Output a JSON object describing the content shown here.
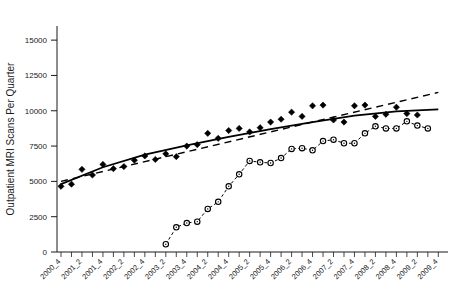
{
  "chart_data": {
    "type": "scatter",
    "title": "",
    "subtitle": "",
    "xlabel": "",
    "ylabel": "Outpatient MRI Scans Per Quarter",
    "ylim": [
      0,
      16000
    ],
    "yticks": [
      0,
      2500,
      5000,
      7500,
      10000,
      12500,
      15000
    ],
    "ytick_labels": [
      "0",
      "2500",
      "5000",
      "7500",
      "10000",
      "12500",
      "15000"
    ],
    "grid": false,
    "legend_position": "none",
    "x": [
      "2000_4",
      "2001_1",
      "2001_2",
      "2001_3",
      "2001_4",
      "2002_1",
      "2002_2",
      "2002_3",
      "2002_4",
      "2003_1",
      "2003_2",
      "2003_3",
      "2003_4",
      "2004_1",
      "2004_2",
      "2004_3",
      "2004_4",
      "2005_1",
      "2005_2",
      "2005_3",
      "2005_4",
      "2006_1",
      "2006_2",
      "2006_3",
      "2006_4",
      "2007_1",
      "2007_2",
      "2007_3",
      "2007_4",
      "2008_1",
      "2008_2",
      "2008_3",
      "2008_4",
      "2009_1",
      "2009_2",
      "2009_3",
      "2009_4"
    ],
    "xtick_labels": [
      "2000_4",
      "2001_2",
      "2001_4",
      "2002_2",
      "2002_4",
      "2003_2",
      "2003_4",
      "2004_2",
      "2004_4",
      "2005_2",
      "2005_4",
      "2006_2",
      "2006_4",
      "2007_2",
      "2007_4",
      "2008_2",
      "2008_4",
      "2009_2",
      "2009_4"
    ],
    "xtick_indices": [
      0,
      2,
      4,
      6,
      8,
      10,
      12,
      14,
      16,
      18,
      20,
      22,
      24,
      26,
      28,
      30,
      32,
      34,
      36
    ],
    "series": [
      {
        "name": "Outpatient MRI scans (hospital)",
        "marker": "filled-diamond",
        "line": "none",
        "color": "#000000",
        "values": [
          4650,
          4800,
          5850,
          5450,
          6200,
          5900,
          6050,
          6500,
          6800,
          6550,
          6950,
          6750,
          7500,
          7600,
          8400,
          8050,
          8600,
          8750,
          8500,
          8800,
          9200,
          9400,
          9900,
          9600,
          10350,
          10400,
          9350,
          9200,
          10350,
          10400,
          9600,
          9750,
          10250,
          9800,
          9700,
          null,
          null
        ]
      },
      {
        "name": "Outpatient MRI scans (freestanding)",
        "marker": "open-circle",
        "line": "dashed",
        "color": "#000000",
        "values": [
          null,
          null,
          null,
          null,
          null,
          null,
          null,
          null,
          null,
          null,
          550,
          1750,
          2050,
          2150,
          3050,
          3550,
          4650,
          5500,
          6450,
          6350,
          6300,
          6650,
          7300,
          7350,
          7200,
          7850,
          7950,
          7700,
          7700,
          8400,
          8900,
          8750,
          8750,
          9250,
          8950,
          8750,
          null
        ]
      }
    ],
    "trendlines": [
      {
        "name": "quadratic-fit-solid",
        "style": "solid",
        "color": "#000000",
        "points": [
          [
            0,
            4800
          ],
          [
            4,
            6000
          ],
          [
            8,
            6900
          ],
          [
            12,
            7550
          ],
          [
            16,
            8150
          ],
          [
            20,
            8700
          ],
          [
            24,
            9200
          ],
          [
            28,
            9650
          ],
          [
            32,
            9950
          ],
          [
            36,
            10100
          ]
        ]
      },
      {
        "name": "linear-fit-dashed",
        "style": "dashed",
        "color": "#000000",
        "points": [
          [
            0,
            5000
          ],
          [
            36,
            11300
          ]
        ]
      }
    ]
  },
  "axes": {
    "y_axis_label": "Outpatient MRI Scans Per Quarter"
  }
}
